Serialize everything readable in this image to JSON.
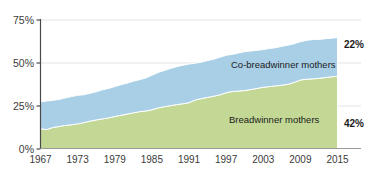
{
  "chart_data": {
    "type": "area",
    "stacked": true,
    "title": "",
    "subtitle": "",
    "xlabel": "",
    "ylabel": "",
    "grid": true,
    "legend_position": "inline-annotation",
    "xlim": [
      1967,
      2015
    ],
    "ylim": [
      0,
      75
    ],
    "ytick_labels": [
      "0%",
      "25%",
      "50%",
      "75%"
    ],
    "ytick_values": [
      0,
      25,
      50,
      75
    ],
    "xtick_labels": [
      "1967",
      "1973",
      "1979",
      "1985",
      "1991",
      "1997",
      "2003",
      "2009",
      "2015"
    ],
    "xtick_values": [
      1967,
      1973,
      1979,
      1985,
      1991,
      1997,
      2003,
      2009,
      2015
    ],
    "x": [
      1967,
      1968,
      1969,
      1970,
      1971,
      1972,
      1973,
      1974,
      1975,
      1976,
      1977,
      1978,
      1979,
      1980,
      1981,
      1982,
      1983,
      1984,
      1985,
      1986,
      1987,
      1988,
      1989,
      1990,
      1991,
      1992,
      1993,
      1994,
      1995,
      1996,
      1997,
      1998,
      1999,
      2000,
      2001,
      2002,
      2003,
      2004,
      2005,
      2006,
      2007,
      2008,
      2009,
      2010,
      2011,
      2012,
      2013,
      2014,
      2015
    ],
    "series": [
      {
        "name": "Breadwinner mothers",
        "color": "#c2d894",
        "end_label": "42%",
        "values": [
          11.5,
          11.0,
          12.2,
          12.8,
          13.4,
          13.8,
          14.3,
          15.0,
          15.9,
          16.6,
          17.2,
          17.8,
          18.6,
          19.3,
          20.0,
          20.7,
          21.4,
          21.8,
          22.5,
          23.6,
          24.3,
          24.9,
          25.5,
          26.0,
          26.6,
          28.2,
          29.0,
          29.7,
          30.4,
          31.2,
          32.4,
          33.1,
          33.4,
          33.7,
          34.3,
          34.9,
          35.6,
          36.0,
          36.4,
          36.8,
          37.3,
          38.4,
          39.8,
          40.3,
          40.5,
          40.8,
          41.2,
          41.7,
          42.0
        ]
      },
      {
        "name": "Co-breadwinner mothers",
        "color": "#a9cfe6",
        "end_label": "22%",
        "values": [
          15.5,
          16.6,
          15.8,
          15.7,
          16.0,
          16.4,
          16.6,
          16.2,
          16.2,
          16.4,
          16.9,
          17.1,
          17.4,
          17.8,
          18.0,
          18.4,
          18.6,
          19.2,
          20.1,
          20.6,
          21.0,
          21.6,
          22.1,
          22.4,
          22.5,
          21.4,
          21.2,
          21.4,
          21.5,
          21.9,
          21.8,
          21.6,
          22.1,
          22.6,
          22.4,
          22.2,
          21.9,
          22.1,
          22.2,
          22.6,
          22.8,
          22.5,
          22.3,
          22.6,
          22.8,
          22.6,
          22.6,
          22.4,
          22.5
        ]
      }
    ],
    "totals_note": "Stacked: Breadwinner + Co-breadwinner mothers",
    "colors": {
      "breadwinner": "#c2d894",
      "cobreadwinner": "#a9cfe6",
      "axis": "#4a4a4a",
      "grid": "#e3e3e3",
      "text": "#1c1c1c"
    }
  }
}
